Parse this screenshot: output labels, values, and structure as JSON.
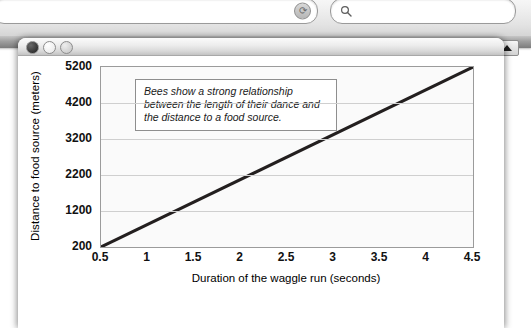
{
  "back_window": {
    "address_bar": {
      "value": "",
      "placeholder": "",
      "reload_icon": "reload-icon"
    },
    "search_bar": {
      "value": "",
      "placeholder": "",
      "search_icon": "search-icon"
    },
    "scroll_up_icon": "triangle-up-icon"
  },
  "front_window": {
    "traffic_lights": [
      "close-dot",
      "minimize-dot",
      "zoom-dot"
    ]
  },
  "chart_data": {
    "type": "line",
    "title": "",
    "xlabel": "Duration of the waggle run (seconds)",
    "ylabel": "Distance to food source (meters)",
    "x_ticks": [
      "0.5",
      "1",
      "1.5",
      "2",
      "2.5",
      "3",
      "3.5",
      "4",
      "4.5"
    ],
    "x_tick_values": [
      0.5,
      1,
      1.5,
      2,
      2.5,
      3,
      3.5,
      4,
      4.5
    ],
    "y_ticks": [
      "5200",
      "4200",
      "3200",
      "2200",
      "1200",
      "200"
    ],
    "y_tick_values": [
      5200,
      4200,
      3200,
      2200,
      1200,
      200
    ],
    "xlim": [
      0.5,
      4.5
    ],
    "ylim": [
      200,
      5200
    ],
    "grid": true,
    "legend": "none",
    "series": [
      {
        "name": "Waggle run duration vs distance",
        "color": "#231f1f",
        "x": [
          0.5,
          4.5
        ],
        "values": [
          200,
          5200
        ]
      }
    ],
    "annotations": [
      {
        "name": "relationship-note",
        "text": "Bees show a strong relationship between the length of their dance and the distance to a food source."
      }
    ]
  }
}
